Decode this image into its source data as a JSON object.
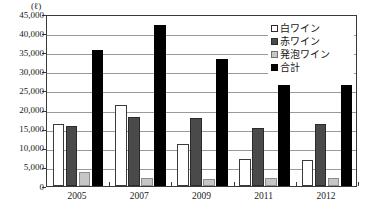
{
  "chart_data": {
    "type": "bar",
    "title": "",
    "subtitle": "",
    "unit_label": "(ℓ)",
    "xlabel": "",
    "ylabel": "",
    "ylim": [
      0,
      45000
    ],
    "ytick_interval": 5000,
    "grid": true,
    "legend_position": "top-right",
    "categories": [
      "2005",
      "2007",
      "2009",
      "2011",
      "2012"
    ],
    "ytick_labels": [
      "0",
      "5,000",
      "10,000",
      "15,000",
      "20,000",
      "25,000",
      "30,000",
      "35,000",
      "40,000",
      "45,000"
    ],
    "ytick_values": [
      0,
      5000,
      10000,
      15000,
      20000,
      25000,
      30000,
      35000,
      40000,
      45000
    ],
    "series": [
      {
        "name": "白ワイン",
        "color": "#ffffff",
        "values": [
          16200,
          21300,
          11000,
          7100,
          6800
        ]
      },
      {
        "name": "赤ワイン",
        "color": "#4a4a4a",
        "values": [
          15600,
          18000,
          17800,
          15300,
          16200
        ]
      },
      {
        "name": "発泡ワイン",
        "color": "#c6c6c6",
        "values": [
          3600,
          2200,
          1900,
          2200,
          2100
        ]
      },
      {
        "name": "合計",
        "color": "#000000",
        "values": [
          35600,
          42200,
          33200,
          26500,
          26400
        ]
      }
    ]
  },
  "legend": {
    "items": [
      {
        "label": "白ワイン",
        "swatch": "white-wine"
      },
      {
        "label": "赤ワイン",
        "swatch": "red-wine"
      },
      {
        "label": "発泡ワイン",
        "swatch": "sparkling-wine"
      },
      {
        "label": "合計",
        "swatch": "total"
      }
    ]
  }
}
